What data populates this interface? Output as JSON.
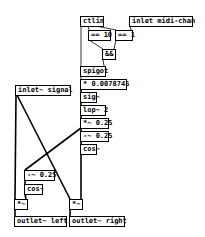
{
  "patch": {
    "objects": [
      {
        "id": "ctlin",
        "label": "ctlin",
        "x": 80,
        "y": 16,
        "w": 24
      },
      {
        "id": "inlet_midi_chan",
        "label": "inlet midi-chan",
        "x": 129,
        "y": 16,
        "w": 64
      },
      {
        "id": "eq10",
        "label": "== 10",
        "x": 88,
        "y": 30,
        "w": 23
      },
      {
        "id": "eq1",
        "label": "== 1",
        "x": 115,
        "y": 30,
        "w": 18
      },
      {
        "id": "and",
        "label": "&&",
        "x": 102,
        "y": 49,
        "w": 14
      },
      {
        "id": "spigot",
        "label": "spigot",
        "x": 80,
        "y": 66,
        "w": 26
      },
      {
        "id": "mul_const",
        "label": "* 0.0078745",
        "x": 80,
        "y": 79,
        "w": 47
      },
      {
        "id": "sig",
        "label": "sig~",
        "x": 80,
        "y": 92,
        "w": 17
      },
      {
        "id": "lop",
        "label": "lop~ 2",
        "x": 80,
        "y": 105,
        "w": 26
      },
      {
        "id": "inlet_signal",
        "label": "inlet~ signal",
        "x": 15,
        "y": 85,
        "w": 56
      },
      {
        "id": "mul_025",
        "label": "*~ 0.25",
        "x": 80,
        "y": 118,
        "w": 29
      },
      {
        "id": "sub_025_r",
        "label": "-~ 0.25",
        "x": 80,
        "y": 131,
        "w": 29
      },
      {
        "id": "cos_r",
        "label": "cos~",
        "x": 80,
        "y": 144,
        "w": 17
      },
      {
        "id": "sub_025_l",
        "label": "-~ 0.25",
        "x": 24,
        "y": 170,
        "w": 31
      },
      {
        "id": "cos_l",
        "label": "cos~",
        "x": 24,
        "y": 184,
        "w": 19
      },
      {
        "id": "mul_l",
        "label": "*~",
        "x": 14,
        "y": 199,
        "w": 14
      },
      {
        "id": "mul_r",
        "label": "*~",
        "x": 69,
        "y": 199,
        "w": 14
      },
      {
        "id": "outlet_left",
        "label": "outlet~ left",
        "x": 14,
        "y": 216,
        "w": 53
      },
      {
        "id": "outlet_right",
        "label": "outlet~ right",
        "x": 69,
        "y": 216,
        "w": 56
      }
    ],
    "connections": [
      {
        "from": "ctlin",
        "to": "spigot",
        "x1": 81,
        "y1": 26,
        "x2": 81,
        "y2": 66
      },
      {
        "from": "ctlin",
        "to": "eq10",
        "x1": 88,
        "y1": 26,
        "x2": 89,
        "y2": 30
      },
      {
        "from": "ctlin",
        "to": "eq1",
        "x1": 96,
        "y1": 26,
        "x2": 116,
        "y2": 30
      },
      {
        "from": "inlet_midi_chan",
        "to": "eq1",
        "x1": 130,
        "y1": 26,
        "x2": 131,
        "y2": 30
      },
      {
        "from": "eq10",
        "to": "and",
        "x1": 89,
        "y1": 40,
        "x2": 103,
        "y2": 49
      },
      {
        "from": "eq1",
        "to": "and",
        "x1": 116,
        "y1": 40,
        "x2": 114,
        "y2": 49
      },
      {
        "from": "and",
        "to": "spigot",
        "x1": 103,
        "y1": 59,
        "x2": 104,
        "y2": 66
      },
      {
        "from": "spigot",
        "to": "mul_const",
        "x1": 81,
        "y1": 76,
        "x2": 81,
        "y2": 79
      },
      {
        "from": "mul_const",
        "to": "sig",
        "x1": 81,
        "y1": 89,
        "x2": 81,
        "y2": 92
      },
      {
        "from": "sig",
        "to": "lop",
        "x1": 81,
        "y1": 102,
        "x2": 81,
        "y2": 105
      },
      {
        "from": "lop",
        "to": "mul_025",
        "x1": 81,
        "y1": 115,
        "x2": 81,
        "y2": 118
      },
      {
        "from": "mul_025",
        "to": "sub_025_r",
        "x1": 81,
        "y1": 128,
        "x2": 81,
        "y2": 131
      },
      {
        "from": "sub_025_r",
        "to": "cos_r",
        "x1": 81,
        "y1": 141,
        "x2": 81,
        "y2": 144
      },
      {
        "from": "mul_025",
        "to": "sub_025_l",
        "x1": 81,
        "y1": 128,
        "x2": 25,
        "y2": 170
      },
      {
        "from": "sub_025_l",
        "to": "cos_l",
        "x1": 25,
        "y1": 180,
        "x2": 25,
        "y2": 184
      },
      {
        "from": "cos_l",
        "to": "mul_l",
        "x1": 25,
        "y1": 194,
        "x2": 26,
        "y2": 199
      },
      {
        "from": "cos_r",
        "to": "mul_r",
        "x1": 81,
        "y1": 154,
        "x2": 81,
        "y2": 199
      },
      {
        "from": "inlet_signal",
        "to": "mul_l",
        "x1": 16,
        "y1": 95,
        "x2": 15,
        "y2": 199
      },
      {
        "from": "inlet_signal",
        "to": "mul_r",
        "x1": 17,
        "y1": 95,
        "x2": 70,
        "y2": 199
      },
      {
        "from": "mul_l",
        "to": "outlet_left",
        "x1": 15,
        "y1": 209,
        "x2": 15,
        "y2": 216
      },
      {
        "from": "mul_r",
        "to": "outlet_right",
        "x1": 70,
        "y1": 209,
        "x2": 70,
        "y2": 216
      }
    ]
  }
}
